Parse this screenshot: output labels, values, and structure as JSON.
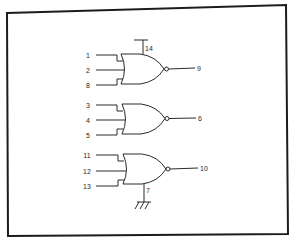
{
  "diagram": {
    "type": "logic-schematic",
    "colors": {
      "line": "#2a2a2a",
      "frame": "#1c1c1c",
      "background": "#ffffff"
    },
    "power_pin": {
      "label": "14"
    },
    "ground_pin": {
      "label": "7"
    },
    "gates": [
      {
        "type": "NOR",
        "inputs": [
          "1",
          "2",
          "8"
        ],
        "output": "9"
      },
      {
        "type": "NOR",
        "inputs": [
          "3",
          "4",
          "5"
        ],
        "output": "6"
      },
      {
        "type": "NOR",
        "inputs": [
          "11",
          "12",
          "13"
        ],
        "output": "10"
      }
    ]
  }
}
